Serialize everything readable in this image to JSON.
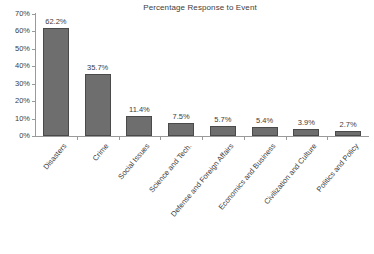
{
  "chart_data": {
    "type": "bar",
    "title": "Percentage Response to Event",
    "xlabel": "",
    "ylabel": "",
    "ylim": [
      0,
      70
    ],
    "grid": false,
    "legend": "none",
    "value_suffix": "%",
    "categories": [
      "Disasters",
      "Crime",
      "Social Issues",
      "Science and Tech.",
      "Defense and Foreign Affairs",
      "Economics and Business",
      "Civilization and Culture",
      "Politics and Policy"
    ],
    "values": [
      62.2,
      35.7,
      11.4,
      7.5,
      5.7,
      5.4,
      3.9,
      2.7
    ],
    "data_labels": [
      "62.2%",
      "35.7%",
      "11.4%",
      "7.5%",
      "5.7%",
      "5.4%",
      "3.9%",
      "2.7%"
    ],
    "ytick_labels": [
      "70%",
      "60%",
      "50%",
      "40%",
      "30%",
      "20%",
      "10%",
      "0%"
    ],
    "ytick_values": [
      70,
      60,
      50,
      40,
      30,
      20,
      10,
      0
    ],
    "bar_color": "#6e6e6e",
    "bar_edge_color": "#4a4a4a",
    "axis_color": "#9a9a9a",
    "text_color": "#3d3d3d",
    "background": "#ffffff"
  }
}
